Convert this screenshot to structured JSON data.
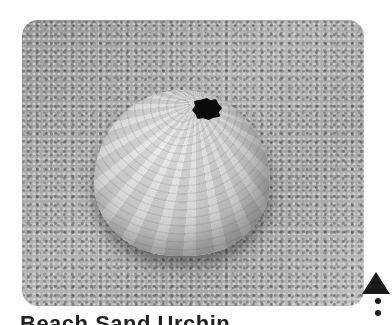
{
  "photo": {
    "alt": "Sea urchin shell resting on sand",
    "subject": "sea-urchin-shell",
    "palette": {
      "sand": "#a8a8a8",
      "shell": "#d8d8d8",
      "hole": "#0a0a0a"
    }
  },
  "caption": {
    "title": "Beach Sand Urchin"
  },
  "controls": {
    "scroll_top_icon": "triangle-up-icon",
    "more_icon": "vertical-dots-icon"
  },
  "colors": {
    "background": "#ffffff",
    "text": "#222222",
    "icon": "#1a1a1a"
  }
}
